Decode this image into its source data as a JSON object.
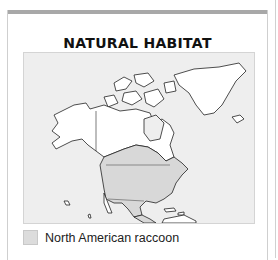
{
  "panel": {
    "title": "NATURAL HABITAT",
    "legend": [
      {
        "label": "North American raccoon",
        "color": "#dcdcdc"
      }
    ],
    "map": {
      "region": "North America",
      "ocean_color": "#eeeeee",
      "land_color": "#ffffff",
      "habitat_color": "#d8d8d8"
    }
  }
}
